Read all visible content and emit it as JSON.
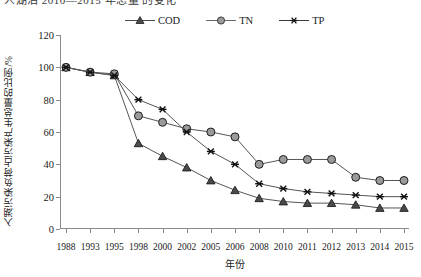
{
  "top_fragment": "人湖泊 2010—2015 年总量 的变化",
  "chart_data": {
    "type": "line",
    "title": "",
    "xlabel": "年份",
    "ylabel": "入湖污染负荷占污染产生总量的比例/%",
    "categories": [
      "1988",
      "1993",
      "1995",
      "1998",
      "2000",
      "2002",
      "2005",
      "2006",
      "2008",
      "2010",
      "2011",
      "2012",
      "2013",
      "2014",
      "2015"
    ],
    "ylim": [
      0,
      120
    ],
    "yticks": [
      0,
      20,
      40,
      60,
      80,
      100,
      120
    ],
    "grid": false,
    "legend_position": "top-center",
    "series": [
      {
        "name": "COD",
        "marker": "triangle",
        "color": "#4a4a4a",
        "values": [
          100,
          97,
          95,
          53,
          45,
          38,
          30,
          24,
          19,
          17,
          16,
          16,
          15,
          13,
          13
        ]
      },
      {
        "name": "TN",
        "marker": "circle",
        "color": "#8c8c8c",
        "values": [
          100,
          97,
          96,
          70,
          66,
          62,
          60,
          57,
          40,
          43,
          43,
          43,
          32,
          30,
          30
        ]
      },
      {
        "name": "TP",
        "marker": "asterisk",
        "color": "#3a3a3a",
        "values": [
          100,
          97,
          95,
          80,
          74,
          60,
          48,
          40,
          28,
          25,
          23,
          22,
          21,
          20,
          20
        ]
      }
    ]
  },
  "legend": {
    "items": [
      {
        "label": "COD"
      },
      {
        "label": "TN"
      },
      {
        "label": "TP"
      }
    ]
  }
}
